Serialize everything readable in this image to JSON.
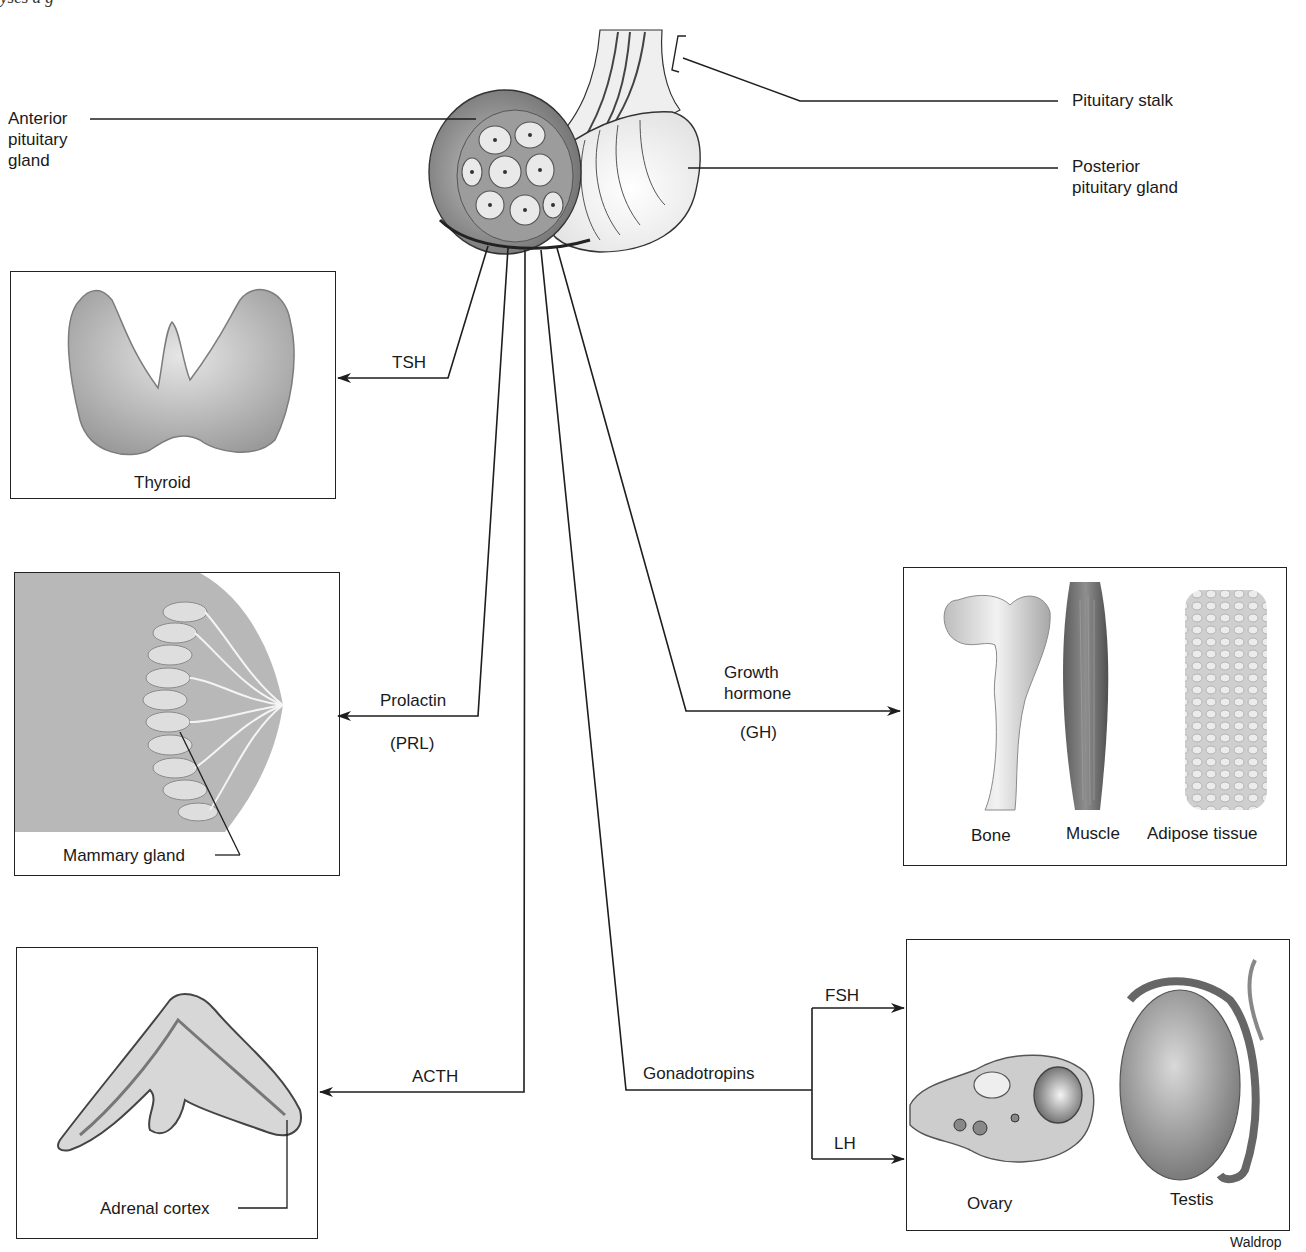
{
  "caption_fragment": "yses a     g            ",
  "pituitary": {
    "anterior_label": [
      "Anterior",
      "pituitary",
      "gland"
    ],
    "stalk_label": "Pituitary stalk",
    "posterior_label": [
      "Posterior",
      "pituitary gland"
    ]
  },
  "hormones": {
    "tsh": "TSH",
    "prolactin": "Prolactin",
    "prolactin_abbr": "(PRL)",
    "acth": "ACTH",
    "gh": [
      "Growth",
      "hormone"
    ],
    "gh_abbr": "(GH)",
    "gonadotropins": "Gonadotropins",
    "fsh": "FSH",
    "lh": "LH"
  },
  "targets": {
    "thyroid": "Thyroid",
    "mammary": "Mammary gland",
    "adrenal": "Adrenal cortex",
    "bone": "Bone",
    "muscle": "Muscle",
    "adipose": "Adipose tissue",
    "ovary": "Ovary",
    "testis": "Testis"
  },
  "credit": "Waldrop",
  "colors": {
    "line": "#1e1e1e",
    "tissue_gray": "#a8a8a8",
    "tissue_light": "#d8d8d8",
    "breast_bg": "#b9b9b9"
  }
}
